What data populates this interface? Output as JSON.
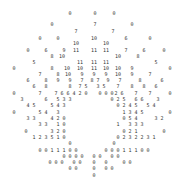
{
  "chart_data": {
    "type": "table",
    "title": "",
    "grid": false,
    "text_color": "#333333",
    "background": "#ffffff",
    "points": [
      {
        "x": 70,
        "y": 13,
        "v": "0"
      },
      {
        "x": 95,
        "y": 13,
        "v": "0"
      },
      {
        "x": 114,
        "y": 13,
        "v": "0"
      },
      {
        "x": 52,
        "y": 24,
        "v": "0"
      },
      {
        "x": 95,
        "y": 24,
        "v": "7"
      },
      {
        "x": 132,
        "y": 24,
        "v": "0"
      },
      {
        "x": 76,
        "y": 31,
        "v": "7"
      },
      {
        "x": 113,
        "y": 31,
        "v": "7"
      },
      {
        "x": 40,
        "y": 38,
        "v": "0"
      },
      {
        "x": 58,
        "y": 38,
        "v": "0"
      },
      {
        "x": 94,
        "y": 38,
        "v": "10"
      },
      {
        "x": 126,
        "y": 38,
        "v": "6"
      },
      {
        "x": 150,
        "y": 38,
        "v": "0"
      },
      {
        "x": 76,
        "y": 43,
        "v": "10"
      },
      {
        "x": 106,
        "y": 43,
        "v": "10"
      },
      {
        "x": 28,
        "y": 50,
        "v": "0"
      },
      {
        "x": 46,
        "y": 50,
        "v": "6"
      },
      {
        "x": 64,
        "y": 50,
        "v": "9"
      },
      {
        "x": 76,
        "y": 50,
        "v": "11"
      },
      {
        "x": 94,
        "y": 50,
        "v": "11"
      },
      {
        "x": 106,
        "y": 50,
        "v": "11"
      },
      {
        "x": 126,
        "y": 50,
        "v": "7"
      },
      {
        "x": 144,
        "y": 50,
        "v": "6"
      },
      {
        "x": 164,
        "y": 50,
        "v": "0"
      },
      {
        "x": 52,
        "y": 56,
        "v": "8"
      },
      {
        "x": 62,
        "y": 56,
        "v": "10"
      },
      {
        "x": 118,
        "y": 56,
        "v": "10"
      },
      {
        "x": 138,
        "y": 56,
        "v": "8"
      },
      {
        "x": 34,
        "y": 62,
        "v": "5"
      },
      {
        "x": 80,
        "y": 62,
        "v": "11"
      },
      {
        "x": 94,
        "y": 62,
        "v": "11"
      },
      {
        "x": 106,
        "y": 62,
        "v": "11"
      },
      {
        "x": 156,
        "y": 62,
        "v": "5"
      },
      {
        "x": 14,
        "y": 68,
        "v": "0"
      },
      {
        "x": 52,
        "y": 68,
        "v": "8"
      },
      {
        "x": 67,
        "y": 68,
        "v": "10"
      },
      {
        "x": 80,
        "y": 68,
        "v": "10"
      },
      {
        "x": 94,
        "y": 68,
        "v": "11"
      },
      {
        "x": 106,
        "y": 68,
        "v": "10"
      },
      {
        "x": 118,
        "y": 68,
        "v": "10"
      },
      {
        "x": 132,
        "y": 68,
        "v": "9"
      },
      {
        "x": 170,
        "y": 68,
        "v": "0"
      },
      {
        "x": 40,
        "y": 74,
        "v": "7"
      },
      {
        "x": 58,
        "y": 74,
        "v": "8"
      },
      {
        "x": 68,
        "y": 74,
        "v": "10"
      },
      {
        "x": 82,
        "y": 74,
        "v": "9"
      },
      {
        "x": 94,
        "y": 74,
        "v": "9"
      },
      {
        "x": 106,
        "y": 74,
        "v": "9"
      },
      {
        "x": 118,
        "y": 74,
        "v": "10"
      },
      {
        "x": 132,
        "y": 74,
        "v": "9"
      },
      {
        "x": 150,
        "y": 74,
        "v": "7"
      },
      {
        "x": 28,
        "y": 80,
        "v": "6"
      },
      {
        "x": 46,
        "y": 80,
        "v": "8"
      },
      {
        "x": 58,
        "y": 80,
        "v": "9"
      },
      {
        "x": 70,
        "y": 80,
        "v": "9"
      },
      {
        "x": 82,
        "y": 80,
        "v": "7"
      },
      {
        "x": 92,
        "y": 80,
        "v": "8"
      },
      {
        "x": 98,
        "y": 80,
        "v": "7"
      },
      {
        "x": 108,
        "y": 80,
        "v": "9"
      },
      {
        "x": 120,
        "y": 80,
        "v": "7"
      },
      {
        "x": 140,
        "y": 80,
        "v": "8"
      },
      {
        "x": 162,
        "y": 80,
        "v": "6"
      },
      {
        "x": 34,
        "y": 86,
        "v": "6"
      },
      {
        "x": 46,
        "y": 86,
        "v": "8"
      },
      {
        "x": 70,
        "y": 86,
        "v": "8"
      },
      {
        "x": 80,
        "y": 86,
        "v": "7"
      },
      {
        "x": 86,
        "y": 86,
        "v": "5"
      },
      {
        "x": 98,
        "y": 86,
        "v": "3"
      },
      {
        "x": 104,
        "y": 86,
        "v": "5"
      },
      {
        "x": 118,
        "y": 86,
        "v": "7"
      },
      {
        "x": 132,
        "y": 86,
        "v": "8"
      },
      {
        "x": 144,
        "y": 86,
        "v": "8"
      },
      {
        "x": 156,
        "y": 86,
        "v": "6"
      },
      {
        "x": 14,
        "y": 93,
        "v": "0"
      },
      {
        "x": 40,
        "y": 93,
        "v": "7"
      },
      {
        "x": 56,
        "y": 93,
        "v": "7"
      },
      {
        "x": 62,
        "y": 93,
        "v": "6"
      },
      {
        "x": 68,
        "y": 93,
        "v": "6"
      },
      {
        "x": 74,
        "y": 93,
        "v": "4"
      },
      {
        "x": 80,
        "y": 93,
        "v": "2"
      },
      {
        "x": 86,
        "y": 93,
        "v": "0"
      },
      {
        "x": 100,
        "y": 93,
        "v": "0"
      },
      {
        "x": 106,
        "y": 93,
        "v": "0"
      },
      {
        "x": 112,
        "y": 93,
        "v": "0"
      },
      {
        "x": 116,
        "y": 93,
        "v": "2"
      },
      {
        "x": 122,
        "y": 93,
        "v": "6"
      },
      {
        "x": 136,
        "y": 93,
        "v": "7"
      },
      {
        "x": 150,
        "y": 93,
        "v": "7"
      },
      {
        "x": 170,
        "y": 93,
        "v": "0"
      },
      {
        "x": 22,
        "y": 99,
        "v": "3"
      },
      {
        "x": 46,
        "y": 99,
        "v": "6"
      },
      {
        "x": 58,
        "y": 99,
        "v": "5"
      },
      {
        "x": 64,
        "y": 99,
        "v": "3"
      },
      {
        "x": 70,
        "y": 99,
        "v": "3"
      },
      {
        "x": 112,
        "y": 99,
        "v": "0"
      },
      {
        "x": 118,
        "y": 99,
        "v": "2"
      },
      {
        "x": 124,
        "y": 99,
        "v": "5"
      },
      {
        "x": 136,
        "y": 99,
        "v": "6"
      },
      {
        "x": 142,
        "y": 99,
        "v": "6"
      },
      {
        "x": 158,
        "y": 99,
        "v": "3"
      },
      {
        "x": 28,
        "y": 105,
        "v": "4"
      },
      {
        "x": 34,
        "y": 105,
        "v": "5"
      },
      {
        "x": 52,
        "y": 105,
        "v": "5"
      },
      {
        "x": 58,
        "y": 105,
        "v": "4"
      },
      {
        "x": 64,
        "y": 105,
        "v": "3"
      },
      {
        "x": 118,
        "y": 105,
        "v": "0"
      },
      {
        "x": 124,
        "y": 105,
        "v": "2"
      },
      {
        "x": 130,
        "y": 105,
        "v": "4"
      },
      {
        "x": 136,
        "y": 105,
        "v": "5"
      },
      {
        "x": 148,
        "y": 105,
        "v": "5"
      },
      {
        "x": 154,
        "y": 105,
        "v": "4"
      },
      {
        "x": 14,
        "y": 112,
        "v": "0"
      },
      {
        "x": 40,
        "y": 112,
        "v": "5"
      },
      {
        "x": 46,
        "y": 112,
        "v": "4"
      },
      {
        "x": 58,
        "y": 112,
        "v": "3"
      },
      {
        "x": 124,
        "y": 112,
        "v": "1"
      },
      {
        "x": 130,
        "y": 112,
        "v": "3"
      },
      {
        "x": 136,
        "y": 112,
        "v": "4"
      },
      {
        "x": 142,
        "y": 112,
        "v": "5"
      },
      {
        "x": 170,
        "y": 112,
        "v": "0"
      },
      {
        "x": 28,
        "y": 118,
        "v": "3"
      },
      {
        "x": 34,
        "y": 118,
        "v": "3"
      },
      {
        "x": 52,
        "y": 118,
        "v": "4"
      },
      {
        "x": 58,
        "y": 118,
        "v": "2"
      },
      {
        "x": 64,
        "y": 118,
        "v": "0"
      },
      {
        "x": 124,
        "y": 118,
        "v": "0"
      },
      {
        "x": 130,
        "y": 118,
        "v": "5"
      },
      {
        "x": 136,
        "y": 118,
        "v": "4"
      },
      {
        "x": 156,
        "y": 118,
        "v": "3"
      },
      {
        "x": 162,
        "y": 118,
        "v": "2"
      },
      {
        "x": 40,
        "y": 124,
        "v": "3"
      },
      {
        "x": 46,
        "y": 124,
        "v": "3"
      },
      {
        "x": 58,
        "y": 124,
        "v": "1"
      },
      {
        "x": 64,
        "y": 124,
        "v": "0"
      },
      {
        "x": 118,
        "y": 124,
        "v": "1"
      },
      {
        "x": 130,
        "y": 124,
        "v": "3"
      },
      {
        "x": 136,
        "y": 124,
        "v": "3"
      },
      {
        "x": 142,
        "y": 124,
        "v": "3"
      },
      {
        "x": 26,
        "y": 131,
        "v": "0"
      },
      {
        "x": 52,
        "y": 131,
        "v": "3"
      },
      {
        "x": 58,
        "y": 131,
        "v": "2"
      },
      {
        "x": 64,
        "y": 131,
        "v": "0"
      },
      {
        "x": 124,
        "y": 131,
        "v": "0"
      },
      {
        "x": 130,
        "y": 131,
        "v": "2"
      },
      {
        "x": 136,
        "y": 131,
        "v": "1"
      },
      {
        "x": 164,
        "y": 131,
        "v": "0"
      },
      {
        "x": 34,
        "y": 137,
        "v": "1"
      },
      {
        "x": 40,
        "y": 137,
        "v": "2"
      },
      {
        "x": 46,
        "y": 137,
        "v": "3"
      },
      {
        "x": 52,
        "y": 137,
        "v": "5"
      },
      {
        "x": 58,
        "y": 137,
        "v": "1"
      },
      {
        "x": 64,
        "y": 137,
        "v": "0"
      },
      {
        "x": 118,
        "y": 137,
        "v": "0"
      },
      {
        "x": 124,
        "y": 137,
        "v": "2"
      },
      {
        "x": 130,
        "y": 137,
        "v": "3"
      },
      {
        "x": 136,
        "y": 137,
        "v": "2"
      },
      {
        "x": 142,
        "y": 137,
        "v": "2"
      },
      {
        "x": 148,
        "y": 137,
        "v": "3"
      },
      {
        "x": 154,
        "y": 137,
        "v": "1"
      },
      {
        "x": 70,
        "y": 143,
        "v": "0"
      },
      {
        "x": 114,
        "y": 143,
        "v": "0"
      },
      {
        "x": 40,
        "y": 150,
        "v": "0"
      },
      {
        "x": 46,
        "y": 150,
        "v": "0"
      },
      {
        "x": 52,
        "y": 150,
        "v": "1"
      },
      {
        "x": 58,
        "y": 150,
        "v": "1"
      },
      {
        "x": 64,
        "y": 150,
        "v": "1"
      },
      {
        "x": 70,
        "y": 150,
        "v": "0"
      },
      {
        "x": 76,
        "y": 150,
        "v": "0"
      },
      {
        "x": 106,
        "y": 150,
        "v": "0"
      },
      {
        "x": 112,
        "y": 150,
        "v": "0"
      },
      {
        "x": 118,
        "y": 150,
        "v": "0"
      },
      {
        "x": 124,
        "y": 150,
        "v": "1"
      },
      {
        "x": 130,
        "y": 150,
        "v": "1"
      },
      {
        "x": 136,
        "y": 150,
        "v": "1"
      },
      {
        "x": 142,
        "y": 150,
        "v": "0"
      },
      {
        "x": 148,
        "y": 150,
        "v": "0"
      },
      {
        "x": 64,
        "y": 156,
        "v": "0"
      },
      {
        "x": 70,
        "y": 156,
        "v": "0"
      },
      {
        "x": 76,
        "y": 156,
        "v": "0"
      },
      {
        "x": 82,
        "y": 156,
        "v": "0"
      },
      {
        "x": 94,
        "y": 156,
        "v": "0"
      },
      {
        "x": 100,
        "y": 156,
        "v": "0"
      },
      {
        "x": 112,
        "y": 156,
        "v": "0"
      },
      {
        "x": 118,
        "y": 156,
        "v": "0"
      },
      {
        "x": 50,
        "y": 162,
        "v": "0"
      },
      {
        "x": 56,
        "y": 162,
        "v": "0"
      },
      {
        "x": 62,
        "y": 162,
        "v": "0"
      },
      {
        "x": 74,
        "y": 162,
        "v": "0"
      },
      {
        "x": 80,
        "y": 162,
        "v": "0"
      },
      {
        "x": 94,
        "y": 162,
        "v": "0"
      },
      {
        "x": 106,
        "y": 162,
        "v": "0"
      },
      {
        "x": 124,
        "y": 162,
        "v": "0"
      },
      {
        "x": 130,
        "y": 162,
        "v": "0"
      },
      {
        "x": 70,
        "y": 168,
        "v": "0"
      },
      {
        "x": 76,
        "y": 168,
        "v": "0"
      },
      {
        "x": 94,
        "y": 168,
        "v": "0"
      },
      {
        "x": 106,
        "y": 168,
        "v": "0"
      },
      {
        "x": 112,
        "y": 168,
        "v": "0"
      },
      {
        "x": 94,
        "y": 175,
        "v": "0"
      }
    ]
  }
}
